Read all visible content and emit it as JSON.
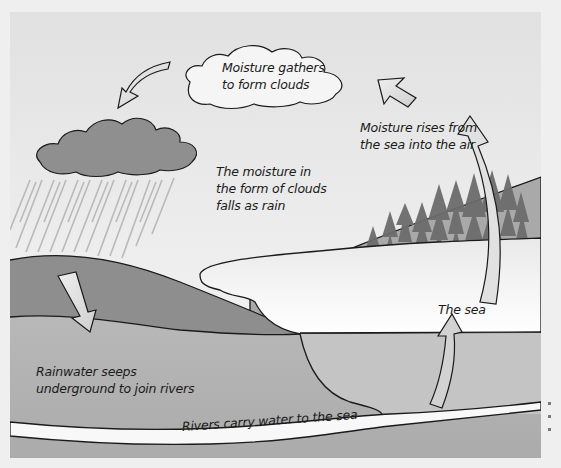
{
  "diagram": {
    "labels": {
      "clouds_gather": [
        "Moisture gathers",
        "to form clouds"
      ],
      "rises": [
        "Moisture rises from",
        "the sea into the air"
      ],
      "rain": [
        "The moisture in",
        "the form of clouds",
        "falls as rain"
      ],
      "seeps": [
        "Rainwater seeps",
        "underground to join rivers"
      ],
      "sea": "The sea",
      "river": "Rivers carry water to the sea"
    },
    "colors": {
      "sky_top": "#e2e2e2",
      "sky_bottom": "#f7f7f7",
      "dark_hill": "#8e8e8e",
      "far_hill": "#a8a8a8",
      "ground": "#b4b4b4",
      "sea": "#fbfbfb",
      "river": "#f8f8f8",
      "rain_cloud": "#8f8f8f",
      "arrow_fill": "#dcdcdc",
      "trees": "#6e6e6e",
      "outline": "#1a1a1a"
    },
    "arrows": [
      {
        "name": "to-rain-cloud",
        "direction": "down-left"
      },
      {
        "name": "evaporation-upper",
        "direction": "up-left"
      },
      {
        "name": "evaporation-side",
        "direction": "up"
      },
      {
        "name": "seeping",
        "direction": "down"
      },
      {
        "name": "sea-rising",
        "direction": "up"
      }
    ]
  }
}
